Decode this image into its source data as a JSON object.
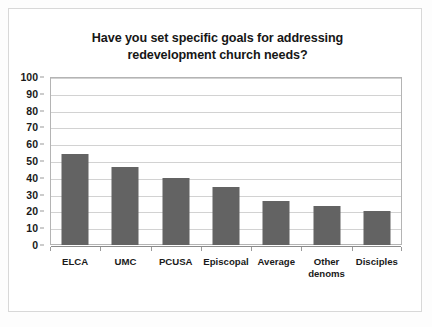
{
  "chart_data": {
    "type": "bar",
    "title": "Have you set specific goals for addressing redevelopment church needs?",
    "title_lines": [
      "Have you set specific goals for addressing",
      "redevelopment church needs?"
    ],
    "categories": [
      "ELCA",
      "UMC",
      "PCUSA",
      "Episcopal",
      "Average",
      "Other denoms",
      "Disciples"
    ],
    "category_labels": [
      "ELCA",
      "UMC",
      "PCUSA",
      "Episcopal",
      "Average",
      "Other\ndenoms",
      "Disciples"
    ],
    "values": [
      54,
      46.5,
      40,
      34.5,
      26,
      23.5,
      20
    ],
    "xlabel": "",
    "ylabel": "",
    "ylim": [
      0,
      100
    ],
    "ytick_step": 10,
    "yticks": [
      100,
      90,
      80,
      70,
      60,
      50,
      40,
      30,
      20,
      10,
      0
    ],
    "ytick_labels": [
      "100",
      "90",
      "80",
      "70",
      "60",
      "50",
      "40",
      "30",
      "20",
      "10",
      "0"
    ],
    "grid": true,
    "grid_axis": "y",
    "legend": false,
    "legend_position": "none",
    "bar_color": "#636363",
    "grid_color": "#d2d2d2",
    "plot_border_color": "#b4b4b4",
    "axis_text_color": "#1a1a1a",
    "background_color": "#ffffff",
    "frame_color": "#d8d8d8"
  }
}
